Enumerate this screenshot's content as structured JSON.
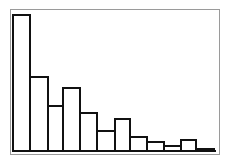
{
  "chart_data": {
    "type": "bar",
    "title": "",
    "xlabel": "",
    "ylabel": "",
    "categories": [
      "1",
      "2",
      "3",
      "4",
      "5",
      "6",
      "7",
      "8",
      "9",
      "10",
      "11",
      "12"
    ],
    "values": [
      136,
      74,
      45,
      63,
      38,
      20,
      32,
      14,
      9,
      5,
      11,
      2
    ],
    "grid": false,
    "legend": null,
    "style": "histogram, unfilled bars with black outlines, no axis labels or ticks"
  },
  "colors": {
    "bar_fill": "#ffffff",
    "bar_stroke": "#111111",
    "frame": "#9a9a9a"
  }
}
